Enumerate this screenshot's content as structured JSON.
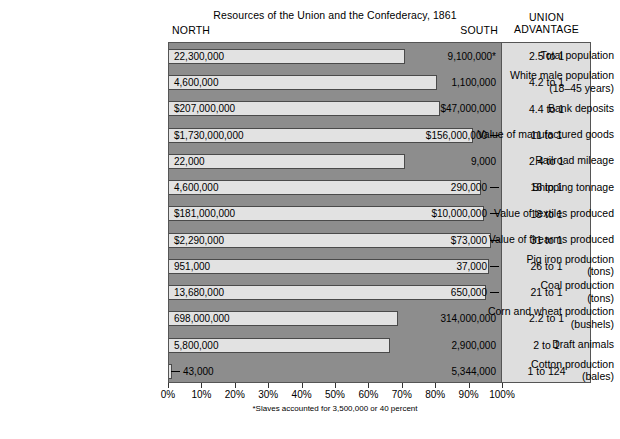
{
  "chart_data": {
    "type": "bar",
    "title": "Resources of the Union and the Confederacy, 1861",
    "subtitle": "",
    "xlabel": "",
    "ylabel": "",
    "xlim": [
      0,
      100
    ],
    "grid": false,
    "legend_position": "none",
    "orientation": "horizontal",
    "stacked": true,
    "columns": {
      "north": "NORTH",
      "south": "SOUTH",
      "union_advantage_line1": "UNION",
      "union_advantage_line2": "ADVANTAGE"
    },
    "xticks": [
      "0%",
      "10%",
      "20%",
      "30%",
      "40%",
      "50%",
      "60%",
      "70%",
      "80%",
      "90%",
      "100%"
    ],
    "xtick_values": [
      0,
      10,
      20,
      30,
      40,
      50,
      60,
      70,
      80,
      90,
      100
    ],
    "footnote": "*Slaves accounted for 3,500,000 or 40 percent",
    "categories": [
      "Total population",
      "White male population (18–45 years)",
      "Bank deposits",
      "Value of manufactured goods",
      "Railroad mileage",
      "Shipping tonnage",
      "Value of textiles produced",
      "Value of firearms produced",
      "Pig iron production (tons)",
      "Coal production (tons)",
      "Corn and wheat production (bushels)",
      "Draft animals",
      "Cotton production (bales)"
    ],
    "series": [
      {
        "name": "NORTH",
        "color": "#e2e2e2",
        "values": [
          71.0,
          80.7,
          81.5,
          91.7,
          71.0,
          94.1,
          94.8,
          96.9,
          96.3,
          95.5,
          69.0,
          66.7,
          0.8
        ]
      },
      {
        "name": "SOUTH",
        "color": "#8d8d8d",
        "values": [
          29.0,
          19.3,
          18.5,
          8.3,
          29.0,
          5.9,
          5.2,
          3.1,
          3.7,
          4.5,
          31.0,
          33.3,
          99.2
        ]
      }
    ],
    "rows": [
      {
        "label_lines": [
          "Total population"
        ],
        "north_value": "22,300,000",
        "south_value": "9,100,000*",
        "advantage": "2.5 to 1",
        "north_pct": 71.0,
        "south_tick": false
      },
      {
        "label_lines": [
          "White male population",
          "(18–45 years)"
        ],
        "north_value": "4,600,000",
        "south_value": "1,100,000",
        "advantage": "4.2 to 1",
        "north_pct": 80.7,
        "south_tick": false
      },
      {
        "label_lines": [
          "Bank deposits"
        ],
        "north_value": "$207,000,000",
        "south_value": "$47,000,000",
        "advantage": "4.4 to 1",
        "north_pct": 81.5,
        "south_tick": false
      },
      {
        "label_lines": [
          "Value of manufactured goods"
        ],
        "north_value": "$1,730,000,000",
        "south_value": "$156,000,000",
        "advantage": "11 to 1",
        "north_pct": 91.7,
        "south_tick": true
      },
      {
        "label_lines": [
          "Railroad mileage"
        ],
        "north_value": "22,000",
        "south_value": "9,000",
        "advantage": "2.4 to 1",
        "north_pct": 71.0,
        "south_tick": false
      },
      {
        "label_lines": [
          "Shipping tonnage"
        ],
        "north_value": "4,600,000",
        "south_value": "290,000",
        "advantage": "16 to 1",
        "north_pct": 94.1,
        "south_tick": true
      },
      {
        "label_lines": [
          "Value of textiles produced"
        ],
        "north_value": "$181,000,000",
        "south_value": "$10,000,000",
        "advantage": "18 to 1",
        "north_pct": 94.8,
        "south_tick": true
      },
      {
        "label_lines": [
          "Value of firearms produced"
        ],
        "north_value": "$2,290,000",
        "south_value": "$73,000",
        "advantage": "31 to 1",
        "north_pct": 96.9,
        "south_tick": true
      },
      {
        "label_lines": [
          "Pig iron production",
          "(tons)"
        ],
        "north_value": "951,000",
        "south_value": "37,000",
        "advantage": "26 to 1",
        "north_pct": 96.3,
        "south_tick": true
      },
      {
        "label_lines": [
          "Coal production",
          "(tons)"
        ],
        "north_value": "13,680,000",
        "south_value": "650,000",
        "advantage": "21 to 1",
        "north_pct": 95.5,
        "south_tick": true
      },
      {
        "label_lines": [
          "Corn and wheat production",
          "(bushels)"
        ],
        "north_value": "698,000,000",
        "south_value": "314,000,000",
        "advantage": "2.2 to 1",
        "north_pct": 69.0,
        "south_tick": false
      },
      {
        "label_lines": [
          "Draft animals"
        ],
        "north_value": "5,800,000",
        "south_value": "2,900,000",
        "advantage": "2 to 1",
        "north_pct": 66.7,
        "south_tick": false
      },
      {
        "label_lines": [
          "Cotton production",
          "(bales)"
        ],
        "north_value": "43,000",
        "south_value": "5,344,000",
        "advantage": "1 to 124",
        "north_pct": 0.8,
        "south_tick": false,
        "north_tick": true
      }
    ]
  },
  "colors": {
    "north_bar": "#e2e2e2",
    "south_bar": "#8d8d8d",
    "advantage_panel": "#dedede",
    "frame": "#555555",
    "text": "#000000",
    "page_background": "#ffffff"
  }
}
